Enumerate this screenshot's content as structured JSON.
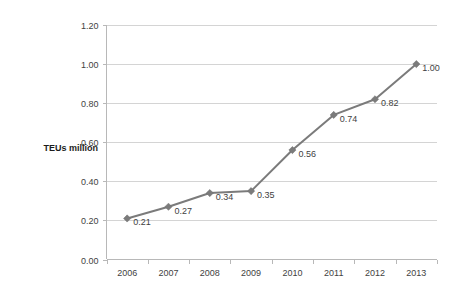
{
  "chart_data": {
    "type": "line",
    "title": "",
    "xlabel": "",
    "ylabel": "TEUs million",
    "categories": [
      "2006",
      "2007",
      "2008",
      "2009",
      "2010",
      "2011",
      "2012",
      "2013"
    ],
    "values": [
      0.21,
      0.27,
      0.34,
      0.35,
      0.56,
      0.74,
      0.82,
      1.0
    ],
    "point_labels": [
      "0.21",
      "0.27",
      "0.34",
      "0.35",
      "0.56",
      "0.74",
      "0.82",
      "1.00"
    ],
    "series": [
      {
        "name": "TEUs million",
        "values": [
          0.21,
          0.27,
          0.34,
          0.35,
          0.56,
          0.74,
          0.82,
          1.0
        ]
      }
    ],
    "ylim": [
      0.0,
      1.2
    ],
    "ytick_values": [
      1.2,
      1.0,
      0.8,
      0.6,
      0.4,
      0.2,
      0.0
    ],
    "ytick_labels": [
      "1.20",
      "1.00",
      "0.80",
      "0.60",
      "0.40",
      "0.20",
      "0.00"
    ],
    "grid": true,
    "grid_axis": "y",
    "legend": false,
    "legend_position": "none",
    "data_labels": true,
    "marker": "diamond",
    "colors": {
      "series": "#7b7b7b",
      "gridline": "#d4d4d4",
      "axis": "#b8b8b8",
      "text": "#3f3f3f",
      "axis_title": "#1c1c1c",
      "background": "#ffffff"
    }
  }
}
